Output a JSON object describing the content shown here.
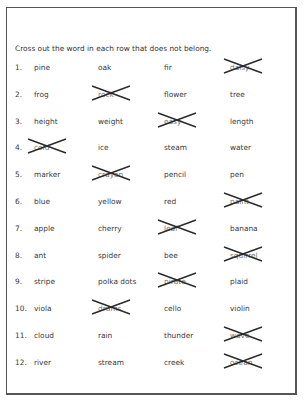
{
  "instructions": "Cross out the word in each row that does not belong.",
  "rows": [
    {
      "number": "1.",
      "words": [
        "pine",
        "oak",
        "fir",
        "daisy"
      ],
      "crossed": 3
    },
    {
      "number": "2.",
      "words": [
        "frog",
        "rock",
        "flower",
        "tree"
      ],
      "crossed": 1
    },
    {
      "number": "3.",
      "words": [
        "height",
        "weight",
        "easy",
        "length"
      ],
      "crossed": 2
    },
    {
      "number": "4.",
      "words": [
        "cold",
        "ice",
        "steam",
        "water"
      ],
      "crossed": 0
    },
    {
      "number": "5.",
      "words": [
        "marker",
        "crayon",
        "pencil",
        "pen"
      ],
      "crossed": 1
    },
    {
      "number": "6.",
      "words": [
        "blue",
        "yellow",
        "red",
        "paint"
      ],
      "crossed": 3
    },
    {
      "number": "7.",
      "words": [
        "apple",
        "cherry",
        "leaf",
        "banana"
      ],
      "crossed": 2
    },
    {
      "number": "8.",
      "words": [
        "ant",
        "spider",
        "bee",
        "squirrel"
      ],
      "crossed": 3
    },
    {
      "number": "9.",
      "words": [
        "stripe",
        "polka dots",
        "pirate",
        "plaid"
      ],
      "crossed": 2
    },
    {
      "number": "10.",
      "words": [
        "viola",
        "drums",
        "cello",
        "violin"
      ],
      "crossed": 1
    },
    {
      "number": "11.",
      "words": [
        "cloud",
        "rain",
        "thunder",
        "wave"
      ],
      "crossed": 3
    },
    {
      "number": "12.",
      "words": [
        "river",
        "stream",
        "creek",
        "ocean"
      ],
      "crossed": 3
    }
  ]
}
